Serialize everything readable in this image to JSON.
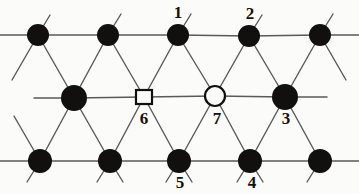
{
  "figure": {
    "background_color": "#fbfbfa",
    "line_color": "#5a5a5a",
    "line_width": 1.4,
    "filled_node_color": "#120f0f",
    "open_node_fill": "#fbfbfa",
    "open_node_stroke": "#120f0f",
    "label_color": "#111111"
  },
  "diagram_data": {
    "type": "lattice-graph",
    "rows": 3,
    "description": "Triangular (hexagonal close packed) lattice fragment drawn as three horizontal rows of sites connected by horizontal and diagonal bonds; seven sites are numbered.",
    "nodes": [
      {
        "id": "t1",
        "shape": "filled-circle",
        "x": 38,
        "y": 35,
        "r": 11,
        "label": "",
        "row": "top"
      },
      {
        "id": "t2",
        "shape": "filled-circle",
        "x": 108,
        "y": 35,
        "r": 11,
        "label": "",
        "row": "top"
      },
      {
        "id": "t3",
        "shape": "filled-circle",
        "x": 178,
        "y": 35,
        "r": 11,
        "label": "1",
        "row": "top"
      },
      {
        "id": "t4",
        "shape": "filled-circle",
        "x": 249,
        "y": 36,
        "r": 11,
        "label": "2",
        "row": "top"
      },
      {
        "id": "t5",
        "shape": "filled-circle",
        "x": 320,
        "y": 35,
        "r": 11,
        "label": "",
        "row": "top"
      },
      {
        "id": "m1",
        "shape": "filled-circle",
        "x": 74,
        "y": 98,
        "r": 13,
        "label": "",
        "row": "middle"
      },
      {
        "id": "m2",
        "shape": "square",
        "x": 144,
        "y": 97,
        "r": 8,
        "label": "6",
        "row": "middle"
      },
      {
        "id": "m3",
        "shape": "open-circle",
        "x": 215,
        "y": 96,
        "r": 10,
        "label": "7",
        "row": "middle"
      },
      {
        "id": "m4",
        "shape": "filled-circle",
        "x": 285,
        "y": 97,
        "r": 13,
        "label": "3",
        "row": "middle"
      },
      {
        "id": "b1",
        "shape": "filled-circle",
        "x": 40,
        "y": 161,
        "r": 12,
        "label": "",
        "row": "bottom"
      },
      {
        "id": "b2",
        "shape": "filled-circle",
        "x": 110,
        "y": 161,
        "r": 12,
        "label": "",
        "row": "bottom"
      },
      {
        "id": "b3",
        "shape": "filled-circle",
        "x": 179,
        "y": 161,
        "r": 12,
        "label": "5",
        "row": "bottom"
      },
      {
        "id": "b4",
        "shape": "filled-circle",
        "x": 250,
        "y": 161,
        "r": 12,
        "label": "4",
        "row": "bottom"
      },
      {
        "id": "b5",
        "shape": "filled-circle",
        "x": 320,
        "y": 161,
        "r": 12,
        "label": "",
        "row": "bottom"
      }
    ],
    "labels": [
      {
        "text": "1",
        "x": 178,
        "y": 12,
        "attached_to": "t3"
      },
      {
        "text": "2",
        "x": 250,
        "y": 13,
        "attached_to": "t4"
      },
      {
        "text": "6",
        "x": 144,
        "y": 118,
        "attached_to": "m2"
      },
      {
        "text": "7",
        "x": 217,
        "y": 118,
        "attached_to": "m3"
      },
      {
        "text": "3",
        "x": 286,
        "y": 118,
        "attached_to": "m4"
      },
      {
        "text": "5",
        "x": 180,
        "y": 182,
        "attached_to": "b3"
      },
      {
        "text": "4",
        "x": 252,
        "y": 182,
        "attached_to": "b4"
      }
    ],
    "edges": [
      {
        "from": "t1",
        "to": "t2",
        "kind": "horizontal"
      },
      {
        "from": "t2",
        "to": "t3",
        "kind": "horizontal"
      },
      {
        "from": "t3",
        "to": "t4",
        "kind": "horizontal"
      },
      {
        "from": "t4",
        "to": "t5",
        "kind": "horizontal"
      },
      {
        "from": "m1",
        "to": "m2",
        "kind": "horizontal"
      },
      {
        "from": "m2",
        "to": "m3",
        "kind": "horizontal"
      },
      {
        "from": "m3",
        "to": "m4",
        "kind": "horizontal"
      },
      {
        "from": "b1",
        "to": "b2",
        "kind": "horizontal"
      },
      {
        "from": "b2",
        "to": "b3",
        "kind": "horizontal"
      },
      {
        "from": "b3",
        "to": "b4",
        "kind": "horizontal"
      },
      {
        "from": "b4",
        "to": "b5",
        "kind": "horizontal"
      },
      {
        "from": "t1",
        "to": "m1",
        "kind": "diagonal"
      },
      {
        "from": "t2",
        "to": "m1",
        "kind": "diagonal"
      },
      {
        "from": "t2",
        "to": "m2",
        "kind": "diagonal"
      },
      {
        "from": "t3",
        "to": "m2",
        "kind": "diagonal"
      },
      {
        "from": "t3",
        "to": "m3",
        "kind": "diagonal"
      },
      {
        "from": "t4",
        "to": "m3",
        "kind": "diagonal"
      },
      {
        "from": "t4",
        "to": "m4",
        "kind": "diagonal"
      },
      {
        "from": "t5",
        "to": "m4",
        "kind": "diagonal"
      },
      {
        "from": "m1",
        "to": "b1",
        "kind": "diagonal"
      },
      {
        "from": "m1",
        "to": "b2",
        "kind": "diagonal"
      },
      {
        "from": "m2",
        "to": "b2",
        "kind": "diagonal"
      },
      {
        "from": "m2",
        "to": "b3",
        "kind": "diagonal"
      },
      {
        "from": "m3",
        "to": "b3",
        "kind": "diagonal"
      },
      {
        "from": "m3",
        "to": "b4",
        "kind": "diagonal"
      },
      {
        "from": "m4",
        "to": "b4",
        "kind": "diagonal"
      },
      {
        "from": "m4",
        "to": "b5",
        "kind": "diagonal"
      }
    ],
    "stubs": [
      {
        "from": "t1",
        "dx": -42,
        "dy": 0
      },
      {
        "from": "t1",
        "dx": 12,
        "dy": -20
      },
      {
        "from": "t2",
        "dx": 13,
        "dy": -21
      },
      {
        "from": "t3",
        "dx": 13,
        "dy": -21
      },
      {
        "from": "t4",
        "dx": 13,
        "dy": -21
      },
      {
        "from": "t5",
        "dx": 13,
        "dy": -21
      },
      {
        "from": "t5",
        "dx": 40,
        "dy": 0
      },
      {
        "from": "t5",
        "dx": 26,
        "dy": 45
      },
      {
        "from": "m1",
        "dx": -40,
        "dy": 0
      },
      {
        "from": "m4",
        "dx": 42,
        "dy": 0
      },
      {
        "from": "b1",
        "dx": -42,
        "dy": 0
      },
      {
        "from": "b1",
        "dx": -13,
        "dy": 21
      },
      {
        "from": "b2",
        "dx": -13,
        "dy": 21
      },
      {
        "from": "b2",
        "dx": 13,
        "dy": 21
      },
      {
        "from": "b3",
        "dx": -13,
        "dy": 21
      },
      {
        "from": "b3",
        "dx": 13,
        "dy": 21
      },
      {
        "from": "b4",
        "dx": -13,
        "dy": 21
      },
      {
        "from": "b4",
        "dx": 13,
        "dy": 21
      },
      {
        "from": "b5",
        "dx": 40,
        "dy": 0
      },
      {
        "from": "b5",
        "dx": -13,
        "dy": 21
      },
      {
        "from": "t1",
        "dx": -26,
        "dy": 45
      },
      {
        "from": "b1",
        "dx": -26,
        "dy": -45
      }
    ]
  }
}
